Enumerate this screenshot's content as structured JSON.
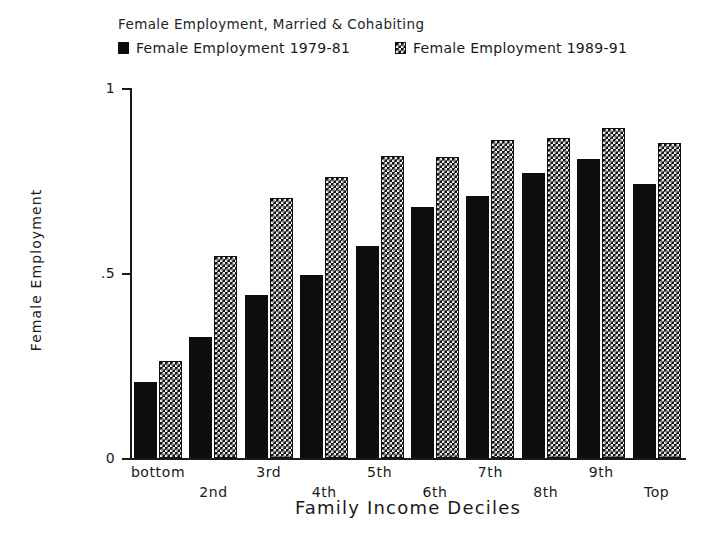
{
  "chart_data": {
    "type": "bar",
    "title": "Female Employment, Married & Cohabiting",
    "xlabel": "Family Income Deciles",
    "ylabel": "Female Employment",
    "ylim": [
      0,
      1
    ],
    "yticks": [
      "0",
      ".5",
      "1"
    ],
    "ytick_values": [
      0,
      0.5,
      1
    ],
    "grid": false,
    "legend_position": "top",
    "categories": [
      "bottom",
      "2nd",
      "3rd",
      "4th",
      "5th",
      "6th",
      "7th",
      "8th",
      "9th",
      "Top"
    ],
    "series": [
      {
        "name": "Female Employment 1979-81",
        "pattern": "solid",
        "values": [
          0.205,
          0.327,
          0.44,
          0.495,
          0.573,
          0.678,
          0.708,
          0.77,
          0.808,
          0.741
        ]
      },
      {
        "name": "Female Employment 1989-91",
        "pattern": "checkerboard",
        "values": [
          0.262,
          0.546,
          0.703,
          0.759,
          0.816,
          0.814,
          0.859,
          0.865,
          0.892,
          0.851
        ]
      }
    ]
  },
  "legend": {
    "entries": [
      {
        "label": "Female Employment 1979-81",
        "swatch": "solid-square-icon"
      },
      {
        "label": "Female Employment 1989-91",
        "swatch": "checkerboard-square-icon"
      }
    ]
  },
  "axes": {
    "y_tick_labels": [
      "1",
      ".5",
      "0"
    ],
    "x_tick_labels_top_row": [
      "bottom",
      "3rd",
      "5th",
      "7th",
      "9th"
    ],
    "x_tick_labels_bottom_row": [
      "2nd",
      "4th",
      "6th",
      "8th",
      "Top"
    ]
  },
  "colors": {
    "ink": "#1a1a1a",
    "bar_solid": "#0d0d0d",
    "bar_hatch_fill": "#141414",
    "bar_hatch_pattern": "#f2f2f2",
    "background": "#ffffff"
  }
}
